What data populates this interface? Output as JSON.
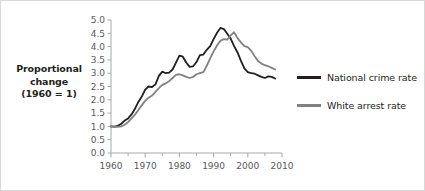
{
  "figure": {
    "border_color": "#d8d8d8",
    "background": "#ffffff"
  },
  "axis_title": {
    "line1": "Proportional",
    "line2": "change",
    "line3": "(1960 = 1)"
  },
  "legend": {
    "items": [
      {
        "label": "National crime rate",
        "color": "#231f20"
      },
      {
        "label": "White arrest rate",
        "color": "#808285"
      }
    ]
  },
  "chart_data": {
    "type": "line",
    "title": "",
    "subtitle": "",
    "xlabel": "",
    "ylabel": "Proportional change (1960 = 1)",
    "xlim": [
      1960,
      2010
    ],
    "ylim": [
      0.0,
      5.0
    ],
    "grid": false,
    "legend_position": "right",
    "x_ticks": [
      1960,
      1970,
      1980,
      1990,
      2000,
      2010
    ],
    "x_tick_labels": [
      "1960",
      "1970",
      "1980",
      "1990",
      "2000",
      "2010"
    ],
    "x_minor_ticks": [
      1965,
      1975,
      1985,
      1995,
      2005
    ],
    "y_ticks": [
      0.0,
      0.5,
      1.0,
      1.5,
      2.0,
      2.5,
      3.0,
      3.5,
      4.0,
      4.5,
      5.0
    ],
    "y_tick_labels": [
      "0.0",
      "0.5",
      "1.0",
      "1.5",
      "2.0",
      "2.5",
      "3.0",
      "3.5",
      "4.0",
      "4.5",
      "5.0"
    ],
    "x": [
      1960,
      1961,
      1962,
      1963,
      1964,
      1965,
      1966,
      1967,
      1968,
      1969,
      1970,
      1971,
      1972,
      1973,
      1974,
      1975,
      1976,
      1977,
      1978,
      1979,
      1980,
      1981,
      1982,
      1983,
      1984,
      1985,
      1986,
      1987,
      1988,
      1989,
      1990,
      1991,
      1992,
      1993,
      1994,
      1995,
      1996,
      1997,
      1998,
      1999,
      2000,
      2001,
      2002,
      2003,
      2004,
      2005,
      2006,
      2007,
      2008
    ],
    "series": [
      {
        "name": "National crime rate",
        "color": "#231f20",
        "values": [
          1.0,
          0.99,
          1.02,
          1.1,
          1.22,
          1.3,
          1.45,
          1.66,
          1.92,
          2.12,
          2.38,
          2.5,
          2.48,
          2.58,
          2.9,
          3.06,
          3.0,
          3.02,
          3.14,
          3.4,
          3.66,
          3.62,
          3.4,
          3.24,
          3.26,
          3.42,
          3.68,
          3.7,
          3.88,
          4.02,
          4.28,
          4.52,
          4.7,
          4.66,
          4.48,
          4.3,
          4.02,
          3.78,
          3.46,
          3.18,
          3.04,
          3.0,
          2.98,
          2.92,
          2.86,
          2.82,
          2.88,
          2.86,
          2.8
        ]
      },
      {
        "name": "White arrest rate",
        "color": "#808285",
        "values": [
          1.0,
          0.98,
          0.98,
          1.0,
          1.06,
          1.16,
          1.3,
          1.44,
          1.62,
          1.8,
          1.96,
          2.08,
          2.16,
          2.3,
          2.44,
          2.56,
          2.62,
          2.7,
          2.82,
          2.94,
          2.96,
          2.92,
          2.86,
          2.82,
          2.86,
          2.96,
          3.0,
          3.04,
          3.28,
          3.56,
          3.82,
          4.04,
          4.22,
          4.28,
          4.26,
          4.42,
          4.54,
          4.32,
          4.16,
          4.02,
          3.98,
          3.84,
          3.64,
          3.46,
          3.36,
          3.3,
          3.26,
          3.2,
          3.14
        ]
      }
    ]
  }
}
